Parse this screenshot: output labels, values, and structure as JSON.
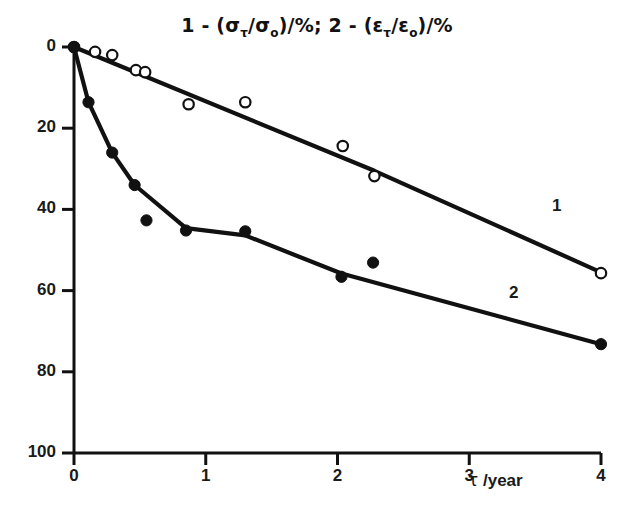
{
  "figure": {
    "title_parts": {
      "series1_prefix": "1 - (",
      "sigma": "σ",
      "sigma_sub_tau": "τ",
      "slash": "/",
      "sigma2": "σ",
      "sigma_sub_o": "o",
      "close_pct": ")/%",
      "separator": "; ",
      "series2_prefix": "2 - (",
      "epsilon": "ε",
      "epsilon_sub_tau": "τ",
      "epsilon2": "ε",
      "epsilon_sub_o": "o"
    },
    "title_plain": "1 - (στ/σo)/%; 2 - (ετ/εo)/%",
    "xaxis_title_symbol": "τ",
    "xaxis_title_unit": " /year",
    "series1_label": "1",
    "series2_label": "2",
    "ink_color": "#111111"
  },
  "chart_data": {
    "type": "line",
    "title": "1 - (στ/σo)/%; 2 - (ετ/εo)/%",
    "xlabel": "τ /year",
    "ylabel": "",
    "xlim": [
      0,
      4
    ],
    "ylim": [
      0,
      100
    ],
    "xticks": [
      0,
      1,
      2,
      3,
      4
    ],
    "yticks": [
      0,
      20,
      40,
      60,
      80,
      100
    ],
    "grid": false,
    "legend": "inline-curve-labels",
    "series": [
      {
        "name": "1",
        "marker": "open-circle",
        "description": "1 - (sigma_tau/sigma_o)/%",
        "points": [
          {
            "x": 0.0,
            "y": 100.0
          },
          {
            "x": 0.16,
            "y": 98.8
          },
          {
            "x": 0.29,
            "y": 98.0
          },
          {
            "x": 0.47,
            "y": 94.3
          },
          {
            "x": 0.54,
            "y": 93.8
          },
          {
            "x": 0.87,
            "y": 85.9
          },
          {
            "x": 1.3,
            "y": 86.4
          },
          {
            "x": 2.04,
            "y": 75.6
          },
          {
            "x": 2.28,
            "y": 68.2
          },
          {
            "x": 4.0,
            "y": 44.3
          }
        ],
        "line_vertices": [
          {
            "x": 0.0,
            "y": 100.0
          },
          {
            "x": 2.28,
            "y": 69.5
          },
          {
            "x": 4.0,
            "y": 44.5
          }
        ]
      },
      {
        "name": "2",
        "marker": "filled-circle",
        "description": "2 - (epsilon_tau/epsilon_o)/%",
        "points": [
          {
            "x": 0.0,
            "y": 100.0
          },
          {
            "x": 0.11,
            "y": 86.4
          },
          {
            "x": 0.29,
            "y": 74.0
          },
          {
            "x": 0.46,
            "y": 66.0
          },
          {
            "x": 0.55,
            "y": 57.3
          },
          {
            "x": 0.85,
            "y": 54.8
          },
          {
            "x": 1.3,
            "y": 54.6
          },
          {
            "x": 2.03,
            "y": 43.4
          },
          {
            "x": 2.27,
            "y": 46.9
          },
          {
            "x": 4.0,
            "y": 26.8
          }
        ],
        "line_vertices": [
          {
            "x": 0.0,
            "y": 100.0
          },
          {
            "x": 0.11,
            "y": 86.4
          },
          {
            "x": 0.29,
            "y": 74.0
          },
          {
            "x": 0.46,
            "y": 66.0
          },
          {
            "x": 0.85,
            "y": 55.4
          },
          {
            "x": 1.3,
            "y": 53.6
          },
          {
            "x": 2.03,
            "y": 44.2
          },
          {
            "x": 4.0,
            "y": 26.8
          }
        ]
      }
    ]
  },
  "axes": {
    "y_tick_labels": [
      "100",
      "80",
      "60",
      "40",
      "20",
      "0"
    ],
    "x_tick_labels": [
      "0",
      "1",
      "2",
      "3",
      "4"
    ]
  }
}
